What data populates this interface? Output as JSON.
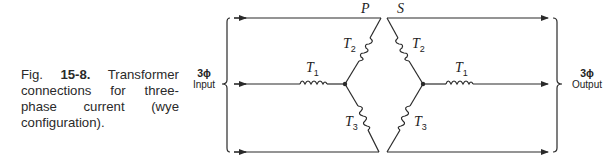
{
  "caption": {
    "fig_prefix": "Fig. ",
    "fig_number": "15-8.",
    "text": " Transformer connections for three-phase current (wye configuration)."
  },
  "input": {
    "phase": "3ϕ",
    "label": "Input"
  },
  "output": {
    "phase": "3ϕ",
    "label": "Output"
  },
  "diagram": {
    "primary_label": "P",
    "secondary_label": "S",
    "coils": {
      "t1_letter": "T",
      "t1_sub": "1",
      "t2_letter": "T",
      "t2_sub": "2",
      "t3_letter": "T",
      "t3_sub": "3"
    },
    "line_color": "#2a2a2a"
  }
}
